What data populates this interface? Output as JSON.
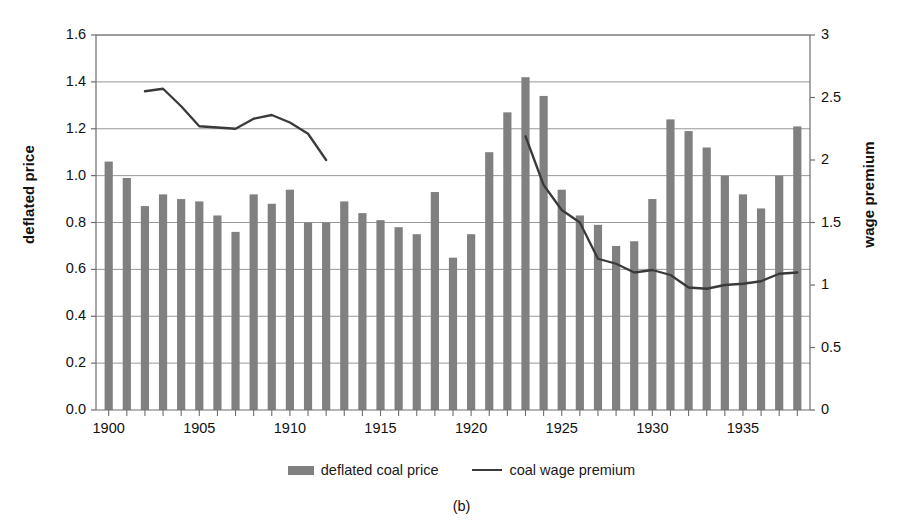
{
  "chart_data": {
    "type": "bar",
    "title": "",
    "caption": "(b)",
    "xlabel": "",
    "ylabel": "deflated price",
    "y2label": "wage premium",
    "grid": true,
    "legend_position": "bottom",
    "ylim": [
      0.0,
      1.6
    ],
    "y2lim": [
      0,
      3
    ],
    "xlim": [
      1899.3,
      1938.7
    ],
    "yticks": [
      "0.0",
      "0.2",
      "0.4",
      "0.6",
      "0.8",
      "1.0",
      "1.2",
      "1.4",
      "1.6"
    ],
    "ytick_values": [
      0.0,
      0.2,
      0.4,
      0.6,
      0.8,
      1.0,
      1.2,
      1.4,
      1.6
    ],
    "y2ticks": [
      "0",
      "0.5",
      "1",
      "1.5",
      "2",
      "2.5",
      "3"
    ],
    "y2tick_values": [
      0,
      0.5,
      1,
      1.5,
      2,
      2.5,
      3
    ],
    "xticks": [
      "1900",
      "1905",
      "1910",
      "1915",
      "1920",
      "1925",
      "1930",
      "1935"
    ],
    "xtick_values": [
      1900,
      1905,
      1910,
      1915,
      1920,
      1925,
      1930,
      1935
    ],
    "categories": [
      1900,
      1901,
      1902,
      1903,
      1904,
      1905,
      1906,
      1907,
      1908,
      1909,
      1910,
      1911,
      1912,
      1913,
      1914,
      1915,
      1916,
      1917,
      1918,
      1919,
      1920,
      1921,
      1922,
      1923,
      1924,
      1925,
      1926,
      1927,
      1928,
      1929,
      1930,
      1931,
      1932,
      1933,
      1934,
      1935,
      1936,
      1937,
      1938
    ],
    "series": [
      {
        "name": "deflated coal price",
        "type": "bar",
        "axis": "left",
        "color": "#808080",
        "values": [
          1.06,
          0.99,
          0.87,
          0.92,
          0.9,
          0.89,
          0.83,
          0.76,
          0.92,
          0.88,
          0.94,
          0.8,
          0.8,
          0.89,
          0.84,
          0.81,
          0.78,
          0.75,
          0.93,
          0.65,
          0.75,
          1.1,
          1.27,
          1.42,
          1.34,
          0.94,
          0.83,
          0.79,
          0.7,
          0.72,
          0.9,
          1.24,
          1.19,
          1.12,
          1.0,
          0.92,
          0.86,
          1.0,
          1.21
        ]
      },
      {
        "name": "coal wage premium",
        "type": "line",
        "axis": "right",
        "color": "#3a3a3a",
        "x": [
          1902,
          1903,
          1904,
          1905,
          1906,
          1907,
          1908,
          1909,
          1910,
          1911,
          1912,
          1923,
          1924,
          1925,
          1926,
          1927,
          1928,
          1929,
          1930,
          1931,
          1932,
          1933,
          1934,
          1935,
          1936,
          1937,
          1938
        ],
        "values": [
          2.55,
          2.57,
          2.43,
          2.27,
          2.26,
          2.25,
          2.33,
          2.36,
          2.3,
          2.21,
          2.0,
          2.19,
          1.8,
          1.6,
          1.5,
          1.21,
          1.17,
          1.1,
          1.12,
          1.08,
          0.98,
          0.97,
          1.0,
          1.01,
          1.03,
          1.09,
          1.1
        ]
      }
    ],
    "legend": [
      {
        "label": "deflated coal price",
        "marker": "bar-swatch",
        "color": "#808080"
      },
      {
        "label": "coal wage premium",
        "marker": "line-swatch",
        "color": "#3a3a3a"
      }
    ]
  }
}
